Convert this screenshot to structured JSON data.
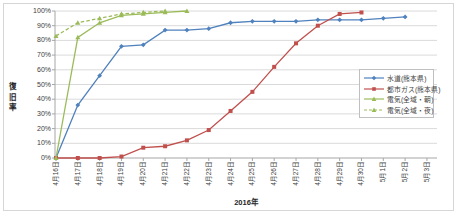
{
  "chart_data": {
    "type": "line",
    "title": "",
    "xlabel": "2016年",
    "ylabel": "復旧率",
    "ylim": [
      0,
      100
    ],
    "grid": true,
    "legend_position": "middle-right",
    "yticks": [
      "0%",
      "10%",
      "20%",
      "30%",
      "40%",
      "50%",
      "60%",
      "70%",
      "80%",
      "90%",
      "100%"
    ],
    "categories": [
      "4月16日",
      "4月17日",
      "4月18日",
      "4月19日",
      "4月20日",
      "4月21日",
      "4月22日",
      "4月23日",
      "4月24日",
      "4月25日",
      "4月26日",
      "4月27日",
      "4月28日",
      "4月29日",
      "4月30日",
      "5月1日",
      "5月2日",
      "5月3日"
    ],
    "series": [
      {
        "name": "水道(熊本県)",
        "color": "#4F81BD",
        "marker": "diamond",
        "dash": false,
        "values": [
          0,
          36,
          56,
          76,
          77,
          87,
          87,
          88,
          92,
          93,
          93,
          93,
          94,
          94,
          94,
          95,
          96,
          null
        ]
      },
      {
        "name": "都市ガス(熊本県)",
        "color": "#C0504D",
        "marker": "square",
        "dash": false,
        "values": [
          0,
          0,
          0,
          1,
          7,
          8,
          12,
          19,
          32,
          45,
          62,
          78,
          90,
          98,
          99,
          null,
          null,
          null
        ]
      },
      {
        "name": "電気(全域・朝)",
        "color": "#9BBB59",
        "marker": "triangle",
        "dash": false,
        "values": [
          0,
          82,
          92,
          97,
          98,
          99,
          100,
          null,
          null,
          null,
          null,
          null,
          null,
          null,
          null,
          null,
          null,
          null
        ]
      },
      {
        "name": "電気(全域・夜)",
        "color": "#9BBB59",
        "marker": "triangle",
        "dash": true,
        "values": [
          83,
          92,
          95,
          98,
          99,
          100,
          null,
          null,
          null,
          null,
          null,
          null,
          null,
          null,
          null,
          null,
          null,
          null
        ]
      }
    ],
    "colors": {
      "gridline": "#DADADA",
      "axis": "#A6A6A6",
      "frame": "#D6D6D6",
      "text": "#404040"
    }
  }
}
